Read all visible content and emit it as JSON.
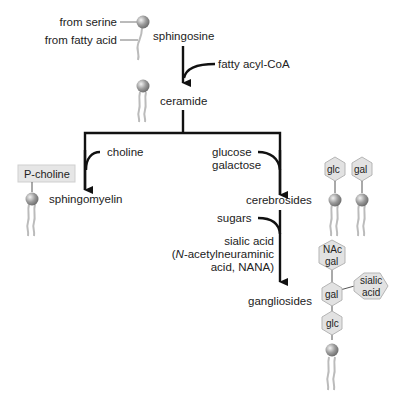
{
  "diagram": {
    "type": "biosynthetic pathway",
    "sphingosine_labels": {
      "head": "from serine",
      "tail": "from fatty acid"
    },
    "nodes": {
      "sphingosine": "sphingosine",
      "ceramide": "ceramide",
      "sphingomyelin": "sphingomyelin",
      "cerebrosides": "cerebrosides",
      "gangliosides": "gangliosides"
    },
    "reagents": {
      "fatty_acyl": "fatty acyl-CoA",
      "choline": "choline",
      "glucose": "glucose",
      "galactose": "galactose",
      "sugars": "sugars",
      "sialic_1": "sialic acid",
      "sialic_2_italic": "N",
      "sialic_2": "-acetylneuraminic",
      "sialic_3": "acid, NANA)",
      "sialic_2_paren": "("
    },
    "headgroups": {
      "pcholine": "P-choline",
      "cereb_glc": "glc",
      "cereb_gal": "gal",
      "gang_nac_1": "NAc",
      "gang_nac_2": "gal",
      "gang_gal": "gal",
      "gang_sialic_1": "sialic",
      "gang_sialic_2": "acid",
      "gang_glc": "glc"
    },
    "colors": {
      "line": "#111111",
      "hex_fill": "#e2e2e2",
      "hex_stroke": "#b5b5b5",
      "box_fill": "#e6e6e6",
      "bead": "#8c8c8c",
      "tail": "#b8b8b8"
    }
  }
}
